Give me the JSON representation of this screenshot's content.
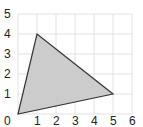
{
  "chart_data": {
    "type": "area",
    "title": "",
    "xlabel": "",
    "ylabel": "",
    "xlim": [
      0,
      6
    ],
    "ylim": [
      0,
      5
    ],
    "grid": true,
    "x_ticks": [
      "0",
      "1",
      "2",
      "3",
      "4",
      "5",
      "6"
    ],
    "y_ticks": [
      "1",
      "2",
      "3",
      "4",
      "5"
    ],
    "series": [
      {
        "name": "triangle",
        "points": [
          [
            0,
            0
          ],
          [
            1,
            4
          ],
          [
            5,
            1
          ]
        ],
        "fill": "#cccccc",
        "stroke": "#333333"
      }
    ]
  },
  "colors": {
    "grid": "#e2e2e2",
    "fill": "#cccccc",
    "stroke": "#333333",
    "text": "#222222"
  }
}
